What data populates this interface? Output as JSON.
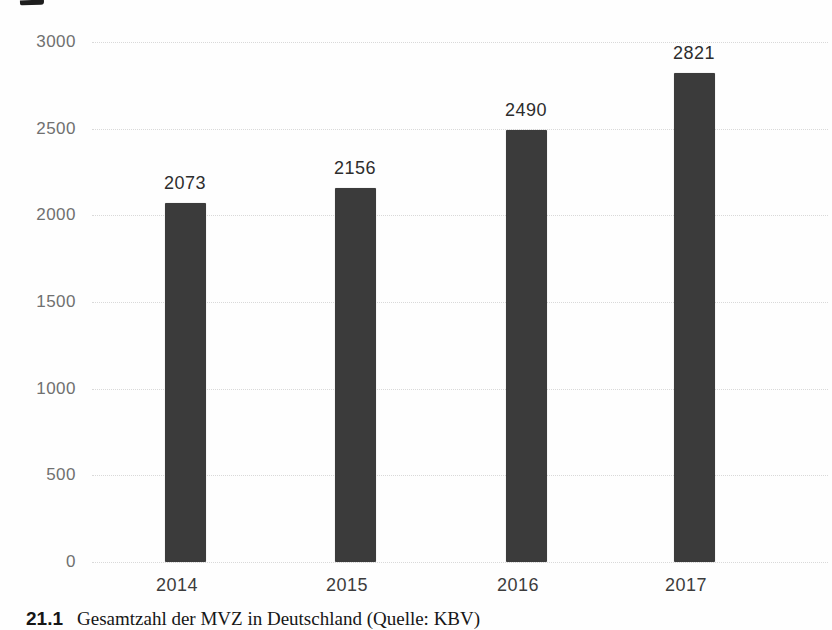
{
  "page": {
    "background": "#fefefe"
  },
  "chart_data": {
    "type": "bar",
    "title": "",
    "xlabel": "",
    "ylabel": "",
    "categories": [
      "2014",
      "2015",
      "2016",
      "2017"
    ],
    "values": [
      2073,
      2156,
      2490,
      2821
    ],
    "value_labels": [
      "2073",
      "2156",
      "2490",
      "2821"
    ],
    "y_ticks": [
      0,
      500,
      1000,
      1500,
      2000,
      2500,
      3000
    ],
    "y_tick_labels": [
      "0",
      "500",
      "1000",
      "1500",
      "2000",
      "2500",
      "3000"
    ],
    "ylim": [
      0,
      3000
    ],
    "grid": "horizontal-dotted",
    "legend": "none",
    "bar_color": "#3b3b3b",
    "gridline_color": "#d6d6d6",
    "tick_label_color": "#707070",
    "value_label_color": "#2d2d2d",
    "category_label_color": "#3c3c3c"
  },
  "caption": {
    "number": "21.1",
    "text": "Gesamtzahl der MVZ in Deutschland (Quelle: KBV)"
  }
}
